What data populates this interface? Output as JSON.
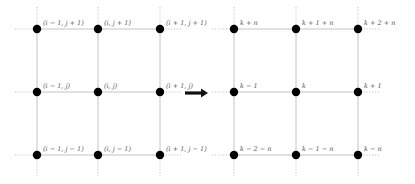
{
  "diagram": {
    "colors": {
      "edge": "#bdbdbd",
      "dash": "#9a9a9a",
      "node": "#000000",
      "label": "#555555",
      "arrow": "#111111"
    },
    "left_grid": {
      "title": "2D index grid",
      "columns_x": [
        37,
        98,
        160
      ],
      "rows_y": [
        29,
        92,
        155
      ],
      "labels": [
        [
          "(i − 1, j + 1)",
          "(i, j + 1)",
          "(i + 1, j + 1)"
        ],
        [
          "(i − 1, j)",
          "(i, j)",
          "(i + 1, j)"
        ],
        [
          "(i − 1, j − 1)",
          "(i, j − 1)",
          "(i + 1, j − 1)"
        ]
      ]
    },
    "arrow": {
      "from_x": 185,
      "to_x": 208,
      "y": 93,
      "meaning": "maps-to"
    },
    "right_grid": {
      "title": "Linear index grid",
      "columns_x": [
        234,
        296,
        358
      ],
      "rows_y": [
        29,
        92,
        155
      ],
      "labels": [
        [
          "k + n",
          "k + 1 + n",
          "k + 2 + n"
        ],
        [
          "k − 1",
          "k",
          "k + 1"
        ],
        [
          "k − 2 − n",
          "k − 1 − n",
          "k − n"
        ]
      ]
    }
  }
}
